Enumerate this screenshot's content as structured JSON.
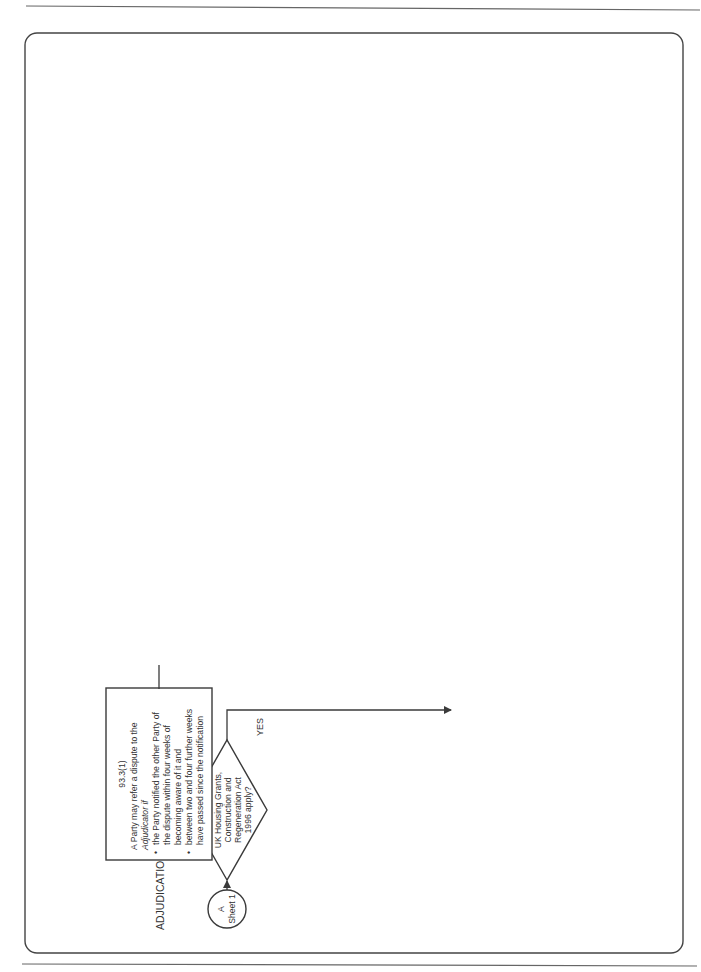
{
  "page": {
    "heading": "ADJUDICATION",
    "footer_title_line1": "Flow charts 93 and 94 Sheet 2 of 4",
    "footer_title_line2": "Dispute resolution"
  },
  "connectors": {
    "start": {
      "letter": "A",
      "sheet": "Sheet 1"
    },
    "end": {
      "letter": "B",
      "sheet": "Sheet 3"
    }
  },
  "decisions": {
    "uk_act": {
      "lines": [
        "Does the",
        "UK Housing Grants,",
        "Construction and",
        "Regeneration Act",
        "1996 apply?"
      ],
      "no_label": "NO",
      "yes_label": "YES"
    },
    "within_terms": {
      "lines": [
        "Is the",
        "disputed matter notified",
        "and referred within the",
        "terms set out in this",
        "contract?"
      ],
      "no_label": "NO",
      "yes_label": "YES"
    },
    "two_to_four": {
      "lines": [
        "Have",
        "between two to four",
        "further weeks passed",
        "since notification?"
      ],
      "no_label": "NO",
      "yes_label": "YES"
    }
  },
  "boxes": {
    "clause_93_3_1_a": {
      "ref": "93.3(1)",
      "lines": [
        "A Party may refer a dispute to the",
        "Adjudicator if",
        "the Party notified the other Party of",
        "the dispute within four weeks of",
        "becoming aware of it and",
        "between two and four further weeks",
        "have passed since the notification"
      ],
      "bullets": [
        2,
        5
      ]
    },
    "may_not_refer": {
      "lines": [
        "The Party",
        "may not refer",
        "the dispute"
      ]
    },
    "clause_93_3_1_b": {
      "ref": "93.3(1)",
      "lines": [
        "If a disputed matter is not",
        "notified and referred within",
        "the times set out in this",
        "contract, neither Party may",
        "subsequently refer it to the",
        "Adjudicator or the tribunal"
      ]
    },
    "finish": {
      "label": "Finish"
    },
    "fc14": {
      "lines": [
        "FC 14",
        "Notify other Party"
      ]
    },
    "referral": {
      "lines": [
        "Referral to",
        "Adjudicator"
      ]
    },
    "clause_94_1": {
      "ref": "94.1",
      "lines": [
        "A Party may issue to the other",
        "Party a notice of his intention to",
        "refer a dispute to adjudication at",
        "any time. He refers the dispute",
        "to the Adjudicator within one",
        "week of the notice"
      ]
    }
  },
  "colors": {
    "line": "#3a3a3a",
    "text": "#333333",
    "background": "#ffffff"
  }
}
